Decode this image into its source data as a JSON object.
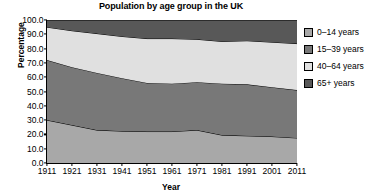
{
  "chart_data": {
    "type": "area",
    "title": "Population by age group in the UK",
    "xlabel": "Year",
    "ylabel": "Percentage",
    "stacked": true,
    "grid": false,
    "legend_position": "right",
    "xlim": [
      1911,
      2011
    ],
    "ylim": [
      0,
      100
    ],
    "categories": [
      1911,
      1921,
      1931,
      1941,
      1951,
      1961,
      1971,
      1981,
      1991,
      2001,
      2011
    ],
    "xticklabels": [
      "1911",
      "1921",
      "1931",
      "1941",
      "1951",
      "1961",
      "1971",
      "1981",
      "1991",
      "2001",
      "2011"
    ],
    "yticks": [
      0,
      10,
      20,
      30,
      40,
      50,
      60,
      70,
      80,
      90,
      100
    ],
    "yticklabels": [
      "0.0",
      "10.0",
      "20.0",
      "30.0",
      "40.0",
      "50.0",
      "60.0",
      "70.0",
      "80.0",
      "90.0",
      "100.0"
    ],
    "series": [
      {
        "name": "0–14 years",
        "color": "#a8a8a8",
        "values": [
          30.0,
          26.5,
          23.0,
          22.3,
          22.0,
          22.0,
          23.0,
          19.5,
          19.0,
          18.5,
          17.5
        ]
      },
      {
        "name": "15–39 years",
        "color": "#787878",
        "values": [
          42.0,
          40.5,
          40.0,
          37.0,
          34.0,
          33.5,
          33.5,
          36.0,
          36.0,
          34.5,
          33.5
        ]
      },
      {
        "name": "40–64 years",
        "color": "#e0e0e0",
        "values": [
          23.0,
          25.5,
          27.5,
          29.2,
          31.0,
          31.5,
          30.0,
          29.5,
          30.5,
          31.5,
          32.5
        ]
      },
      {
        "name": "65+  years",
        "color": "#585858",
        "values": [
          5.0,
          7.5,
          9.5,
          11.5,
          13.0,
          13.0,
          13.5,
          15.0,
          14.5,
          15.5,
          16.5
        ]
      }
    ],
    "cumulative_boundaries": {
      "0-14_top": [
        30.0,
        26.5,
        23.0,
        22.3,
        22.0,
        22.0,
        23.0,
        19.5,
        19.0,
        18.5,
        17.5
      ],
      "15-39_top": [
        72.0,
        67.0,
        63.0,
        59.3,
        56.0,
        55.5,
        56.5,
        55.5,
        55.0,
        53.0,
        51.0
      ],
      "40-64_top": [
        95.0,
        92.5,
        90.5,
        88.5,
        87.0,
        87.0,
        86.5,
        85.0,
        85.5,
        84.5,
        83.5
      ],
      "65+_top": [
        100,
        100,
        100,
        100,
        100,
        100,
        100,
        100,
        100,
        100,
        100
      ]
    }
  },
  "legend": {
    "entries": [
      {
        "label": "0–14 years",
        "color": "#a8a8a8"
      },
      {
        "label": "15–39 years",
        "color": "#787878"
      },
      {
        "label": "40–64 years",
        "color": "#e0e0e0"
      },
      {
        "label": "65+  years",
        "color": "#585858"
      }
    ]
  }
}
